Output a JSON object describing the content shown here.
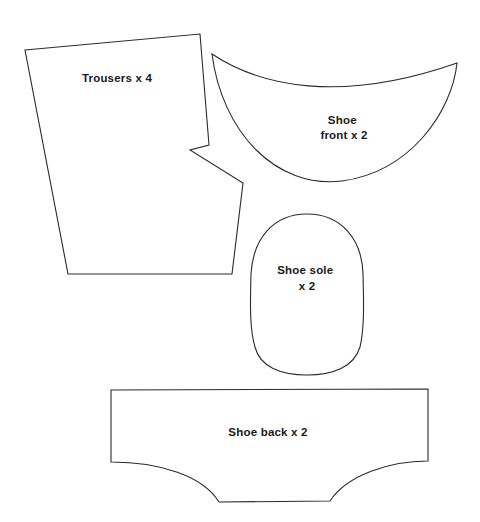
{
  "document": {
    "kind": "sewing-pattern-sheet",
    "background_color": "#ffffff",
    "outline_color": "#2b2b2b",
    "label_color": "#1a1a1a",
    "width": 480,
    "height": 522
  },
  "pieces": [
    {
      "id": "trousers",
      "label_lines": [
        "Trousers x 4"
      ],
      "label": "Trousers x 4",
      "quantity": "x 4",
      "name": "Trousers",
      "label_x": 117,
      "label_y": 82,
      "path": "M 25 50 L 200 34 L 209 145 L 190 150 L 243 183 L 232 274 L 68 274 Z"
    },
    {
      "id": "shoe-front",
      "label_lines": [
        "Shoe",
        "front x 2"
      ],
      "label": "Shoe front x 2",
      "quantity": "x 2",
      "name": "Shoe front",
      "label_x": 344,
      "label_y": 124,
      "path": "M 212 54 C 260 86 340 104 457 63 C 452 112 410 172 342 181 C 276 189 222 132 212 54 Z"
    },
    {
      "id": "shoe-sole",
      "label_lines": [
        "Shoe sole",
        "x 2"
      ],
      "label": "Shoe sole x 2",
      "quantity": "x 2",
      "name": "Shoe sole",
      "label_x": 307,
      "label_y": 274,
      "path": "M 307 214 C 341 214 362 239 363 274 C 364 309 364 330 360 347 C 354 367 333 375 307 375 C 281 375 260 367 255 347 C 250 330 250 309 251 274 C 253 239 273 214 307 214 Z"
    },
    {
      "id": "shoe-back",
      "label_lines": [
        "Shoe back x 2"
      ],
      "label": "Shoe back x 2",
      "quantity": "x 2",
      "name": "Shoe back",
      "label_x": 268,
      "label_y": 436,
      "path": "M 111 390 L 428 389 L 428 461 C 390 461 347 475 330 501 L 219 502 C 203 476 160 462 111 462 Z"
    }
  ]
}
